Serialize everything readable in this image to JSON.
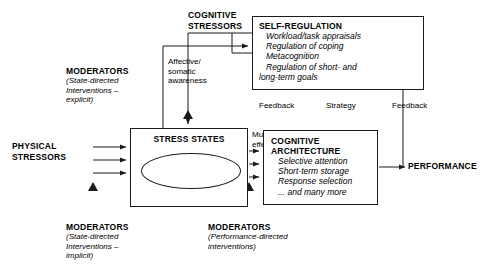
{
  "diagram": {
    "line_color": "#1a1a1a",
    "background": "#ffffff"
  },
  "inputs": {
    "cognitive_stressors": "COGNITIVE\nSTRESSORS",
    "cognitive_stressors_l1": "COGNITIVE",
    "cognitive_stressors_l2": "STRESSORS",
    "physical_stressors_l1": "PHYSICAL",
    "physical_stressors_l2": "STRESSORS"
  },
  "self_regulation": {
    "title": "SELF-REGULATION",
    "items": [
      "Workload/task appraisals",
      "Regulation of coping",
      "Metacognition",
      "Regulation of short- and",
      "long-term goals"
    ]
  },
  "stress_states": {
    "title": "STRESS STATES",
    "sublabel": "Physiological"
  },
  "cognitive_architecture": {
    "title_l1": "COGNITIVE",
    "title_l2": "ARCHITECTURE",
    "items": [
      "Selective attention",
      "Short-term storage",
      "Response selection",
      "... and many more"
    ]
  },
  "performance": {
    "label": "PERFORMANCE"
  },
  "edge_labels": {
    "affective_l1": "Affective/",
    "affective_l2": "somatic",
    "affective_l3": "awareness",
    "multiple_l1": "Multiple",
    "multiple_l2": "effects",
    "feedback_left": "Feedback",
    "strategy": "Strategy",
    "feedback_right": "Feedback"
  },
  "moderators": {
    "explicit": {
      "header": "MODERATORS",
      "l1": "(State-directed",
      "l2": "Interventions –",
      "l3": "explicit)"
    },
    "implicit": {
      "header": "MODERATORS",
      "l1": "(State-directed",
      "l2": "Interventions –",
      "l3": "implicit)"
    },
    "performance_directed": {
      "header": "MODERATORS",
      "l1": "(Performance-directed",
      "l2": "interventions)"
    }
  }
}
